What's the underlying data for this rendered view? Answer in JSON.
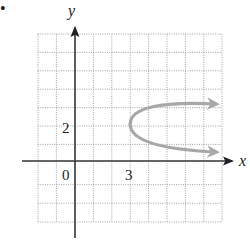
{
  "figure": {
    "bullet": "•",
    "axes": {
      "x_label": "x",
      "y_label": "y",
      "origin_label": "0",
      "x_tick_label": "3",
      "y_tick_label": "2",
      "x_range": [
        -2,
        8
      ],
      "y_range": [
        -3,
        7
      ],
      "grid": true,
      "grid_style": "dotted"
    },
    "curve": {
      "type": "parabola",
      "opens": "right",
      "vertex": [
        3,
        2
      ],
      "equation_hint": "x = 3 + 2.5(y - 2)^2",
      "color": "#a8a8a8",
      "arrowheads": "both ends"
    },
    "colors": {
      "axis": "#333333",
      "grid": "#9a9a9a",
      "curve": "#a8a8a8",
      "text": "#222222"
    }
  }
}
